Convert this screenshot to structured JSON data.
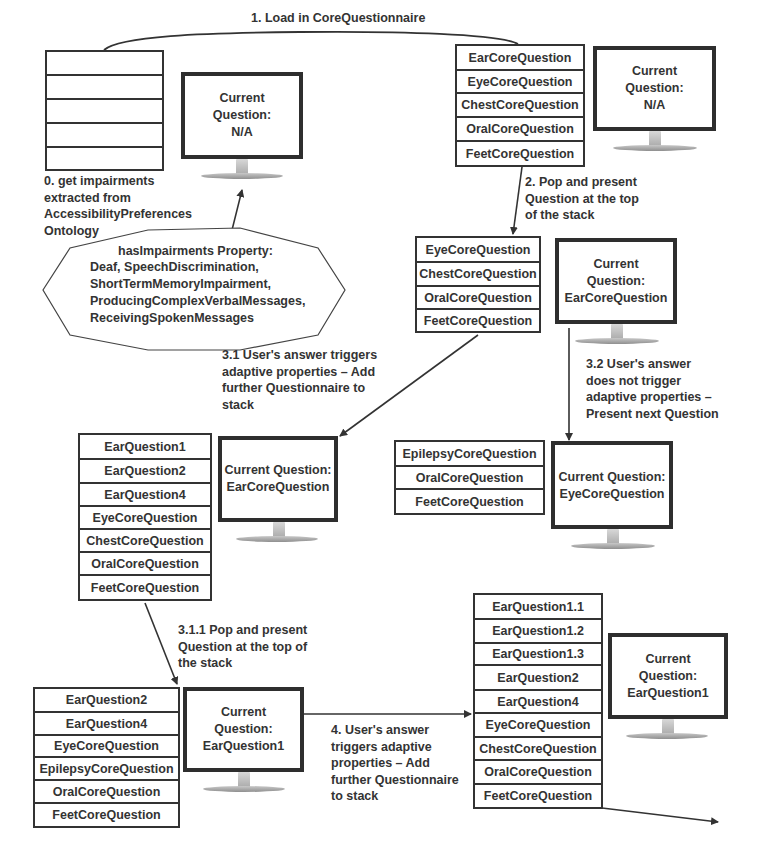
{
  "diagram": {
    "steps": {
      "s0": "0. get impairments\nextracted from\nAccessibilityPreferences\nOntology",
      "s1": "1. Load in CoreQuestionnaire",
      "s2": "2. Pop and present\nQuestion at the top\nof the stack",
      "s31": "3.1 User's answer triggers\nadaptive properties – Add\nfurther Questionnaire to\nstack",
      "s32": "3.2 User's answer\ndoes not trigger\nadaptive properties –\nPresent next Question",
      "s311": "3.1.1 Pop and present\nQuestion at the top of\nthe stack",
      "s4": "4. User's answer\ntriggers adaptive\nproperties – Add\nfurther Questionnaire\nto stack"
    },
    "ontology": {
      "title": "hasImpairments Property:",
      "items": [
        "Deaf, SpeechDiscrimination,",
        "ShortTermMemoryImpairment,",
        "ProducingComplexVerbalMessages,",
        "ReceivingSpokenMessages"
      ]
    },
    "stacks": {
      "empty": [
        "",
        "",
        "",
        "",
        ""
      ],
      "initial": [
        "EarCoreQuestion",
        "EyeCoreQuestion",
        "ChestCoreQuestion",
        "OralCoreQuestion",
        "FeetCoreQuestion"
      ],
      "after_pop": [
        "EyeCoreQuestion",
        "ChestCoreQuestion",
        "OralCoreQuestion",
        "FeetCoreQuestion"
      ],
      "added_ear": [
        "EarQuestion1",
        "EarQuestion2",
        "EarQuestion4",
        "EyeCoreQuestion",
        "ChestCoreQuestion",
        "OralCoreQuestion",
        "FeetCoreQuestion"
      ],
      "next_question": [
        "EpilepsyCoreQuestion",
        "OralCoreQuestion",
        "FeetCoreQuestion"
      ],
      "after_pop_ear": [
        "EarQuestion2",
        "EarQuestion4",
        "EyeCoreQuestion",
        "EpilepsyCoreQuestion",
        "OralCoreQuestion",
        "FeetCoreQuestion"
      ],
      "added_ear_sub": [
        "EarQuestion1.1",
        "EarQuestion1.2",
        "EarQuestion1.3",
        "EarQuestion2",
        "EarQuestion4",
        "EyeCoreQuestion",
        "ChestCoreQuestion",
        "OralCoreQuestion",
        "FeetCoreQuestion"
      ]
    },
    "monitors": {
      "m1": "Current\nQuestion:\nN/A",
      "m2": "Current\nQuestion:\nN/A",
      "m3": "Current\nQuestion:\nEarCoreQuestion",
      "m4": "Current Question:\nEarCoreQuestion",
      "m5": "Current Question:\nEyeCoreQuestion",
      "m6": "Current\nQuestion:\nEarQuestion1",
      "m7": "Current\nQuestion:\nEarQuestion1"
    },
    "colors": {
      "line": "#333333",
      "text": "#333333",
      "background": "#ffffff"
    }
  }
}
